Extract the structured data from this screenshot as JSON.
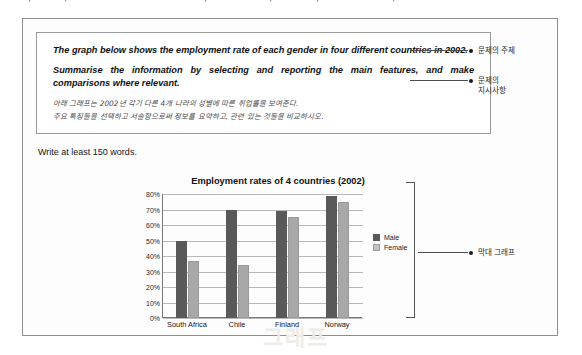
{
  "top_bleed": "ㅣㅡㅣ ㅡㅡ ㄱㅡ ㅡㅣ ㅡㅡㅣㅡ ㅣㅡ ㅡ ㅣㅡㅡ",
  "task": {
    "statement_1": "The graph below shows the employment rate of each gender in four different countries in 2002.",
    "statement_2": "Summarise the information by selecting and reporting the main features, and make comparisons where relevant.",
    "korean_1": "아래 그래프는 2002년 각기 다른 4개 나라의 성별에 따른 취업률을 보여준다.",
    "korean_2": "주요 특징들을 선택하고 서술함으로써 정보를 요약하고, 관련 있는 것들을 비교하시오."
  },
  "write_note": "Write at least 150 words.",
  "annotations": {
    "topic": "문제의 주제",
    "instruction": "문제의\n지시사항",
    "chart": "막대 그래프"
  },
  "legend": {
    "male": "Male",
    "female": "Female"
  },
  "colors": {
    "male_bar": "#595959",
    "female_bar": "#a8a8a8",
    "frame": "#8e8e8e",
    "gridline": "#b9b9b9"
  },
  "chart_data": {
    "type": "bar",
    "title": "Employment rates of 4 countries (2002)",
    "xlabel": "",
    "ylabel": "",
    "categories": [
      "South Africa",
      "Chile",
      "Finland",
      "Norway"
    ],
    "series": [
      {
        "name": "Male",
        "values": [
          50,
          70,
          69,
          79
        ]
      },
      {
        "name": "Female",
        "values": [
          37,
          34,
          65,
          75
        ]
      }
    ],
    "ylim": [
      0,
      80
    ],
    "yticks": [
      "0%",
      "10%",
      "20%",
      "30%",
      "40%",
      "50%",
      "60%",
      "70%",
      "80%"
    ],
    "ytick_values": [
      0,
      10,
      20,
      30,
      40,
      50,
      60,
      70,
      80
    ],
    "grid": true,
    "legend_position": "right"
  },
  "ghost_text": {
    "a": "그래픽",
    "b": "그래프"
  }
}
